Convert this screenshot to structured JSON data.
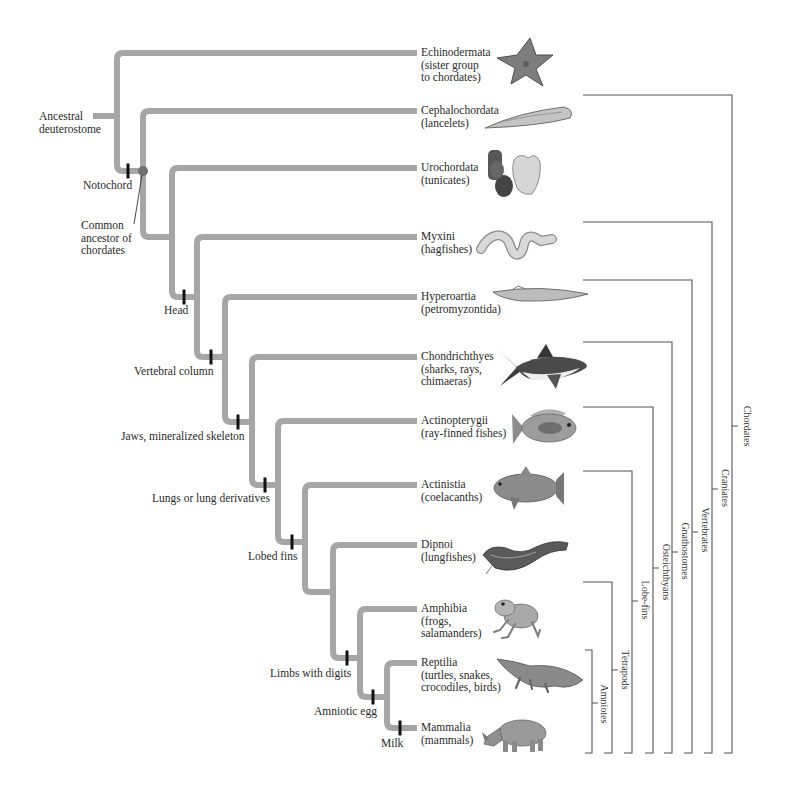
{
  "figure": {
    "root": {
      "lines": [
        "Ancestral",
        "deuterostome"
      ]
    },
    "common_ancestor": {
      "lines": [
        "Common",
        "ancestor of",
        "chordates"
      ]
    },
    "taxa": [
      {
        "name": "Echinodermata",
        "desc": [
          "(sister group",
          "to chordates)"
        ],
        "image": "sea-star"
      },
      {
        "name": "Cephalochordata",
        "desc": [
          "(lancelets)"
        ],
        "image": "lancelet"
      },
      {
        "name": "Urochordata",
        "desc": [
          "(tunicates)"
        ],
        "image": "tunicates"
      },
      {
        "name": "Myxini",
        "desc": [
          "(hagfishes)"
        ],
        "image": "hagfish"
      },
      {
        "name": "Hyperoartia",
        "desc": [
          "(petromyzontida)"
        ],
        "image": "lamprey"
      },
      {
        "name": "Chondrichthyes",
        "desc": [
          "(sharks, rays,",
          "chimaeras)"
        ],
        "image": "shark"
      },
      {
        "name": "Actinopterygii",
        "desc": [
          "(ray-finned fishes)"
        ],
        "image": "ray-finned-fish"
      },
      {
        "name": "Actinistia",
        "desc": [
          "(coelacanths)"
        ],
        "image": "coelacanth"
      },
      {
        "name": "Dipnoi",
        "desc": [
          "(lungfishes)"
        ],
        "image": "lungfish"
      },
      {
        "name": "Amphibia",
        "desc": [
          "(frogs,",
          "salamanders)"
        ],
        "image": "frog"
      },
      {
        "name": "Reptilia",
        "desc": [
          "(turtles, snakes,",
          "crocodiles, birds)"
        ],
        "image": "crocodile"
      },
      {
        "name": "Mammalia",
        "desc": [
          "(mammals)"
        ],
        "image": "rhinoceros"
      }
    ],
    "traits": [
      "Notochord",
      "Head",
      "Vertebral column",
      "Jaws, mineralized skeleton",
      "Lungs or lung derivatives",
      "Lobed fins",
      "Limbs with digits",
      "Amniotic egg",
      "Milk"
    ],
    "clades": [
      "Chordates",
      "Craniates",
      "Vertebrates",
      "Gnathostomes",
      "Osteichthyans",
      "Lobe-fins",
      "Tetrapods",
      "Amniotes"
    ]
  },
  "colors": {
    "branch": "#a6a6a6",
    "trait_tick": "#111111",
    "ancestor_dot": "#707070",
    "bracket": "#555555",
    "text": "#2a2a2a"
  }
}
